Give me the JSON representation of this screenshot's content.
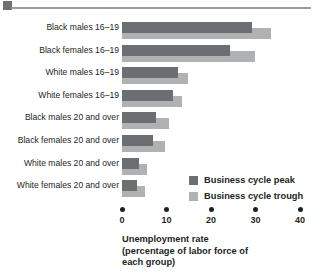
{
  "chart_data": {
    "type": "bar",
    "orientation": "horizontal",
    "title": "",
    "xlabel": "Unemployment rate (percentage of labor force of each group)",
    "xlabel_lines": [
      "Unemployment rate",
      "(percentage of labor force of",
      "each group)"
    ],
    "ylabel": "",
    "xlim": [
      0,
      40
    ],
    "xticks": [
      0,
      10,
      20,
      30,
      40
    ],
    "xtick_labels": [
      "0",
      "10",
      "20",
      "30",
      "40"
    ],
    "grid": false,
    "legend_position": "middle-right",
    "categories": [
      "Black males 16–19",
      "Black females 16–19",
      "White males 16–19",
      "White females 16–19",
      "Black males 20 and over",
      "Black females 20 and over",
      "White males 20 and over",
      "White females 20 and over"
    ],
    "series": [
      {
        "name": "Business cycle peak",
        "color": "#6d6e71",
        "values": [
          29.2,
          24.2,
          12.5,
          11.4,
          7.6,
          6.9,
          3.8,
          3.4
        ]
      },
      {
        "name": "Business cycle trough",
        "color": "#b0b1b3",
        "values": [
          33.5,
          29.8,
          14.8,
          13.4,
          10.5,
          9.6,
          5.6,
          5.1
        ]
      }
    ]
  },
  "legend": {
    "items": [
      {
        "label": "Business cycle peak",
        "color": "#6d6e71"
      },
      {
        "label": "Business cycle trough",
        "color": "#b0b1b3"
      }
    ]
  },
  "axis": {
    "title_line_1": "Unemployment rate",
    "title_line_2": "(percentage of labor force of",
    "title_line_3": "each group)"
  },
  "colors": {
    "peak": "#6d6e71",
    "trough": "#b0b1b3",
    "text": "#231f20",
    "rule": "#9a9b9d",
    "rule_square": "#6f7072",
    "background": "#ffffff"
  }
}
